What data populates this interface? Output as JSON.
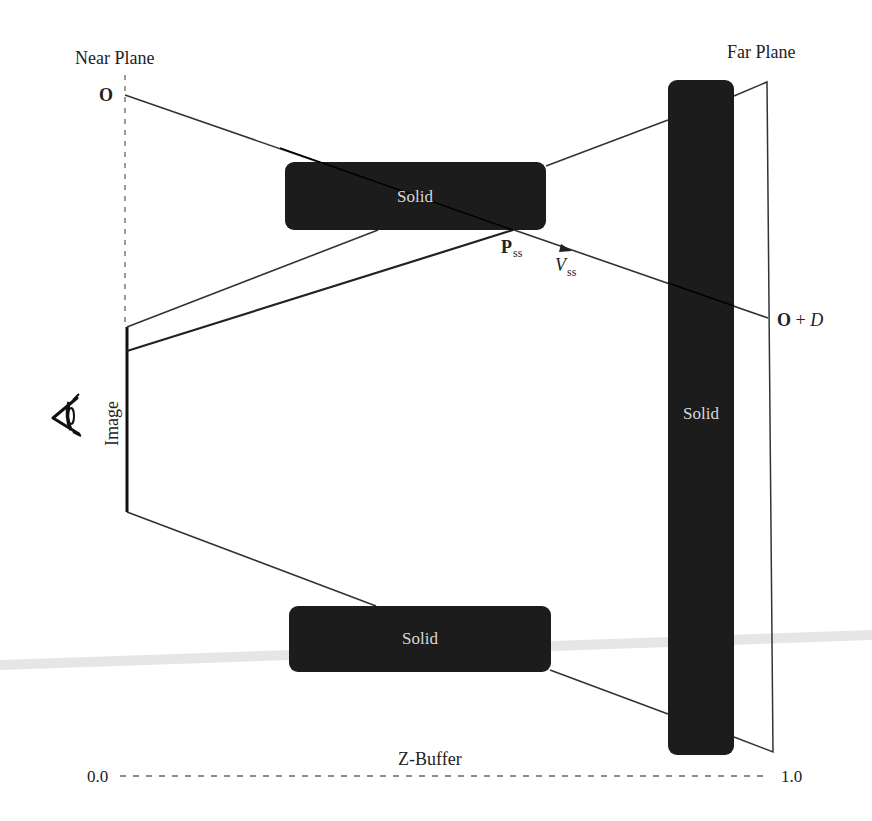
{
  "diagram": {
    "colors": {
      "solid_fill": "#1c1c1c",
      "solid_text": "#d8d8d8",
      "line": "#333333",
      "label": "#222222",
      "dash": "#666666",
      "streak": "#d9d9d9"
    },
    "labels": {
      "near_plane": "Near Plane",
      "far_plane": "Far Plane",
      "origin": "O",
      "endpoint_bold": "O",
      "endpoint_plus": " + ",
      "endpoint_italic": "D",
      "pss_main": "P",
      "pss_sub": "ss",
      "vss_main": "V",
      "vss_sub": "ss",
      "image": "Image",
      "zbuffer": "Z-Buffer",
      "zbuffer_min": "0.0",
      "zbuffer_max": "1.0"
    },
    "solids": [
      {
        "id": "top",
        "label": "Solid",
        "x": 285,
        "y": 162,
        "w": 261,
        "h": 68
      },
      {
        "id": "bottom",
        "label": "Solid",
        "x": 289,
        "y": 606,
        "w": 262,
        "h": 66
      },
      {
        "id": "tall",
        "label": "Solid",
        "x": 668,
        "y": 80,
        "w": 66,
        "h": 675
      }
    ],
    "icons": {
      "eye": "eye-icon"
    }
  }
}
